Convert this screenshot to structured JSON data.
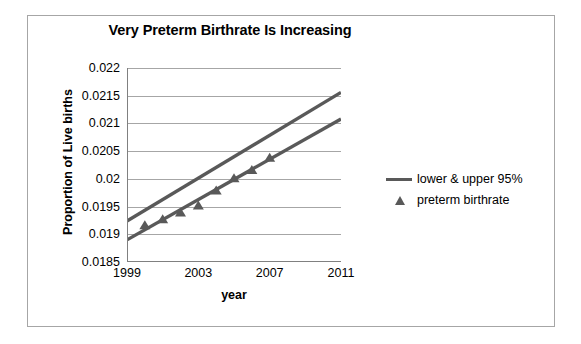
{
  "chart_data": {
    "type": "scatter",
    "title": "Very Preterm Birthrate Is Increasing",
    "xlabel": "year",
    "ylabel": "Proportion of Live births",
    "xlim": [
      1999,
      2011
    ],
    "ylim": [
      0.0185,
      0.022
    ],
    "grid": true,
    "legend_position": "right",
    "x_ticks": [
      "1999",
      "2003",
      "2007",
      "2011"
    ],
    "x_tick_values": [
      1999,
      2003,
      2007,
      2011
    ],
    "y_ticks": [
      "0.0185",
      "0.019",
      "0.0195",
      "0.02",
      "0.0205",
      "0.021",
      "0.0215",
      "0.022"
    ],
    "y_tick_values": [
      0.0185,
      0.019,
      0.0195,
      0.02,
      0.0205,
      0.021,
      0.0215,
      0.022
    ],
    "series": [
      {
        "name": "preterm birthrate",
        "type": "scatter",
        "marker": "triangle",
        "color": "#595959",
        "x": [
          2000,
          2001,
          2002,
          2003,
          2004,
          2005,
          2006,
          2007
        ],
        "values": [
          0.01917,
          0.01928,
          0.0194,
          0.01953,
          0.0198,
          0.02002,
          0.02017,
          0.02039
        ]
      },
      {
        "name": "upper 95%",
        "type": "line",
        "color": "#595959",
        "x": [
          1999,
          2011
        ],
        "values": [
          0.01924,
          0.02156
        ]
      },
      {
        "name": "lower 95%",
        "type": "line",
        "color": "#595959",
        "x": [
          1999,
          2011
        ],
        "values": [
          0.0189,
          0.02108
        ]
      }
    ],
    "legend": [
      {
        "label": "lower & upper 95%",
        "marker": "line",
        "color": "#595959"
      },
      {
        "label": "preterm birthrate",
        "marker": "triangle",
        "color": "#595959"
      }
    ],
    "colors": {
      "series": "#595959",
      "gridline": "#a6a6a6",
      "axis": "#808080",
      "frame": "#a6a6a6",
      "text": "#000000",
      "background": "#ffffff"
    }
  }
}
